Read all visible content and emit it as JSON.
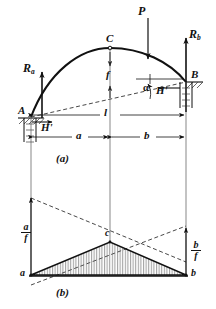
{
  "figure": {
    "title_a": "(a)",
    "title_b": "(b)",
    "panel_a": {
      "labels": {
        "load_P": "P",
        "reaction_left": "R",
        "reaction_left_sub": "a",
        "reaction_right": "R",
        "reaction_right_sub": "b",
        "support_left": "A",
        "support_right": "B",
        "crown": "C",
        "thrust_left": "H'",
        "thrust_right": "H'",
        "rise": "f",
        "span": "l",
        "dim_left": "a",
        "dim_right": "b",
        "angle": "α"
      }
    },
    "panel_b": {
      "labels": {
        "left_node": "a",
        "right_node": "b",
        "apex": "c",
        "left_ordinate_num": "a",
        "left_ordinate_den": "f",
        "right_ordinate_num": "b",
        "right_ordinate_den": "f"
      }
    },
    "colors": {
      "ink": "#111111",
      "hatch": "#555555",
      "dashed": "#333333",
      "background": "#ffffff"
    }
  }
}
